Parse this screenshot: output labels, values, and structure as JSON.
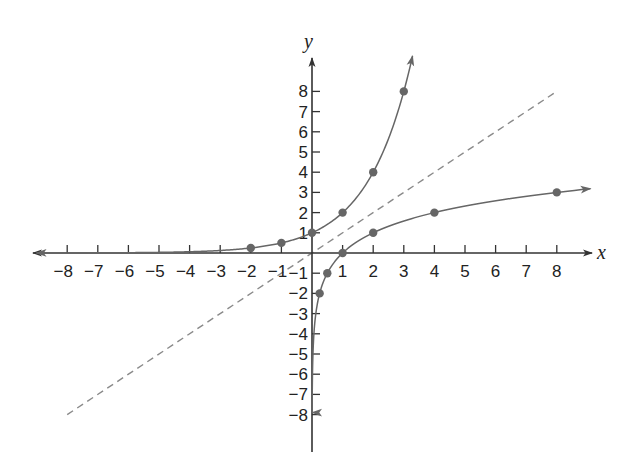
{
  "chart_data": {
    "type": "line",
    "title": "",
    "xlabel": "x",
    "ylabel": "y",
    "xlim": [
      -8,
      8
    ],
    "ylim": [
      -8,
      8
    ],
    "grid": false,
    "legend": null,
    "x_ticks": [
      -8,
      -7,
      -6,
      -5,
      -4,
      -3,
      -2,
      -1,
      1,
      2,
      3,
      4,
      5,
      6,
      7,
      8
    ],
    "y_ticks": [
      -8,
      -7,
      -6,
      -5,
      -4,
      -3,
      -2,
      -1,
      1,
      2,
      3,
      4,
      5,
      6,
      7,
      8
    ],
    "series": [
      {
        "name": "y = 2^x",
        "style": "solid",
        "color": "#666666",
        "points": [
          [
            -2,
            0.25
          ],
          [
            -1,
            0.5
          ],
          [
            0,
            1
          ],
          [
            1,
            2
          ],
          [
            2,
            4
          ],
          [
            3,
            8
          ]
        ],
        "arrows": [
          "left",
          "up"
        ]
      },
      {
        "name": "y = log2(x)",
        "style": "solid",
        "color": "#666666",
        "points": [
          [
            0.25,
            -2
          ],
          [
            0.5,
            -1
          ],
          [
            1,
            0
          ],
          [
            2,
            1
          ],
          [
            4,
            2
          ],
          [
            8,
            3
          ]
        ],
        "arrows": [
          "down",
          "right"
        ]
      },
      {
        "name": "y = x",
        "style": "dashed",
        "color": "#8a8a8a",
        "points": [
          [
            -8,
            -8
          ],
          [
            8,
            8
          ]
        ],
        "arrows": []
      }
    ]
  },
  "layout": {
    "origin_px": [
      312,
      253
    ],
    "x_unit_px": 30.6,
    "y_unit_px": 20.2,
    "axis_color": "#333333",
    "curve_color": "#666666",
    "dashed_color": "#8a8a8a"
  }
}
